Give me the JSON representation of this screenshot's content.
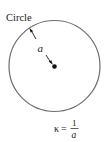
{
  "diagram": {
    "title_label": "Circle",
    "radius_label": "a",
    "formula": {
      "lhs": "κ",
      "equals": "=",
      "numerator": "1",
      "denominator": "a"
    },
    "colors": {
      "circle_stroke": "#6e6e6e",
      "arrow": "#1a1a1a",
      "text": "#1a1a1a"
    }
  }
}
